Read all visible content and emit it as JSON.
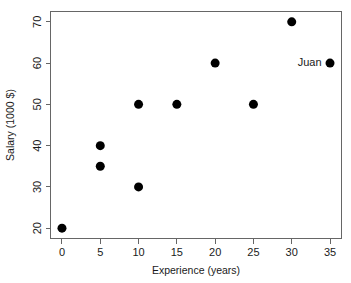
{
  "chart_data": {
    "type": "scatter",
    "title": "",
    "xlabel": "Experience (years)",
    "ylabel": "Salary (1000 $)",
    "xlim": [
      -1.5,
      36.5
    ],
    "ylim": [
      17.5,
      72.5
    ],
    "xticks": [
      0,
      5,
      10,
      15,
      20,
      25,
      30,
      35
    ],
    "yticks": [
      20,
      30,
      40,
      50,
      60,
      70
    ],
    "xticklabels": [
      "0",
      "5",
      "10",
      "15",
      "20",
      "25",
      "30",
      "35"
    ],
    "yticklabels": [
      "20",
      "30",
      "40",
      "50",
      "60",
      "70"
    ],
    "grid": false,
    "legend": false,
    "legend_position": "none",
    "marker": "filled-circle",
    "marker_color": "#000000",
    "marker_size_px": 9,
    "frame_color": "#666666",
    "background_color": "#ffffff",
    "x": [
      0,
      5,
      5,
      10,
      10,
      15,
      20,
      25,
      30,
      35
    ],
    "y": [
      20,
      35,
      40,
      30,
      50,
      50,
      60,
      50,
      70,
      60
    ],
    "points": [
      {
        "x": 0,
        "y": 20,
        "label": ""
      },
      {
        "x": 5,
        "y": 35,
        "label": ""
      },
      {
        "x": 5,
        "y": 40,
        "label": ""
      },
      {
        "x": 10,
        "y": 30,
        "label": ""
      },
      {
        "x": 10,
        "y": 50,
        "label": ""
      },
      {
        "x": 15,
        "y": 50,
        "label": ""
      },
      {
        "x": 20,
        "y": 60,
        "label": ""
      },
      {
        "x": 25,
        "y": 50,
        "label": ""
      },
      {
        "x": 30,
        "y": 70,
        "label": ""
      },
      {
        "x": 35,
        "y": 60,
        "label": "Juan"
      }
    ],
    "annotations": [
      {
        "text": "Juan",
        "x": 35,
        "y": 60,
        "placement": "left-of-point"
      }
    ]
  }
}
